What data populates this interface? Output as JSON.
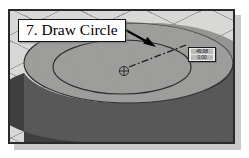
{
  "figure": {
    "caption_label": "7. Draw Circle",
    "step_number": "7",
    "action": "Draw Circle"
  },
  "callout": {
    "text": "7. Draw Circle",
    "arrow": "arrow-pointing-to-circle-edge"
  },
  "viewport": {
    "name": "cad-3d-viewport",
    "view": "isometric",
    "grid_visible": true,
    "background_color": "#d8d8d6",
    "grid_color": "#8c8c8c"
  },
  "model": {
    "name": "cylindrical-disc",
    "top_face_color": "#9d9d9b",
    "top_face_highlight_color": "#8a8a88",
    "side_wall_color": "#4a4a4a",
    "side_wall_light_color": "#6e6e6e",
    "edge_color": "#3a3a3a"
  },
  "sketch": {
    "center_marker": "center-point-marker",
    "radius_line_style": "dash-dot",
    "circle_name": "inner-circle",
    "outer_circle_name": "outer-edge-circle"
  },
  "dimension_readout": {
    "name": "radius-dimension-readout",
    "line1": "49.98",
    "line2": "0.00"
  },
  "colors": {
    "frame_border": "#2a2a2a",
    "callout_border": "#111111",
    "callout_fill": "#ffffff",
    "arrow": "#000000",
    "page_background": "#ffffff"
  }
}
